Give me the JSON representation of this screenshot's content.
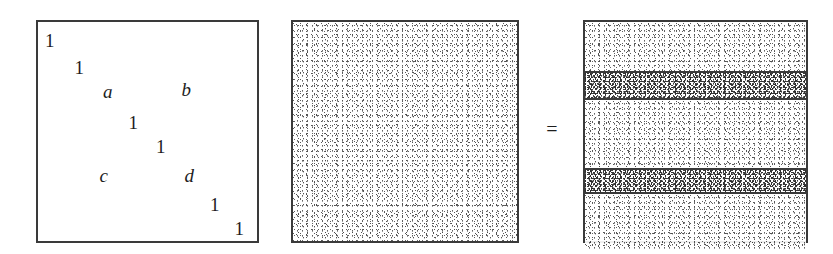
{
  "figure": {
    "caption": "",
    "operator": "=",
    "colors": {
      "border": "#3a3a3a",
      "text": "#1d1d1d",
      "page_background": "#ffffff",
      "light_band_fill": "#f7f7f7",
      "shaded_band_fill": "#bdbdbd"
    }
  },
  "panels": {
    "sparse_matrix": {
      "name": "sparse-elementary-matrix",
      "width": 223,
      "height": 223,
      "entries": [
        {
          "text": "1",
          "kind": "number",
          "x_pct": 5.4,
          "y_pct": 8.1
        },
        {
          "text": "1",
          "kind": "number",
          "x_pct": 18.8,
          "y_pct": 20.6
        },
        {
          "text": "a",
          "kind": "symbol",
          "x_pct": 31.8,
          "y_pct": 31.4
        },
        {
          "text": "b",
          "kind": "symbol",
          "x_pct": 67.7,
          "y_pct": 30.5
        },
        {
          "text": "1",
          "kind": "number",
          "x_pct": 43.5,
          "y_pct": 45.7
        },
        {
          "text": "1",
          "kind": "number",
          "x_pct": 56.1,
          "y_pct": 56.5
        },
        {
          "text": "c",
          "kind": "symbol",
          "x_pct": 30.0,
          "y_pct": 69.9
        },
        {
          "text": "d",
          "kind": "symbol",
          "x_pct": 69.1,
          "y_pct": 69.9
        },
        {
          "text": "1",
          "kind": "number",
          "x_pct": 80.7,
          "y_pct": 82.9
        },
        {
          "text": "1",
          "kind": "number",
          "x_pct": 91.9,
          "y_pct": 94.2
        }
      ]
    },
    "dense_matrix": {
      "name": "dense-stippled-matrix",
      "width": 228,
      "height": 223,
      "fill": "uniform-stipple"
    },
    "banded_matrix": {
      "name": "banded-result-matrix",
      "width": 225,
      "height": 223,
      "bands": [
        {
          "label": "band-1",
          "shaded": false,
          "height_pct": 22.4
        },
        {
          "label": "band-2",
          "shaded": true,
          "height_pct": 11.2
        },
        {
          "label": "band-3",
          "shaded": false,
          "height_pct": 31.4
        },
        {
          "label": "band-4",
          "shaded": true,
          "height_pct": 9.9
        },
        {
          "label": "band-5",
          "shaded": false,
          "height_pct": 25.1
        }
      ]
    }
  }
}
